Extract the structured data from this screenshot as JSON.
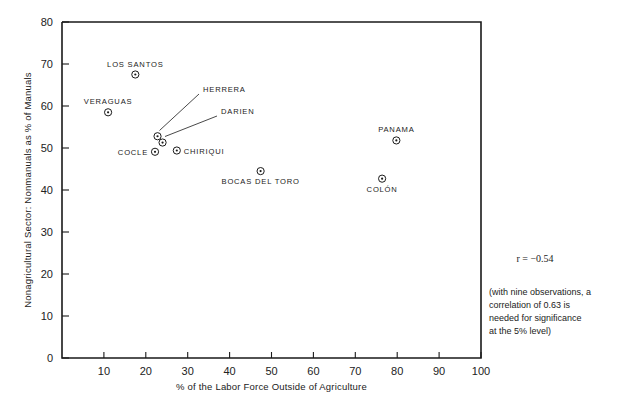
{
  "chart_data": {
    "type": "scatter",
    "title": "",
    "xlabel": "% of the Labor Force Outside of Agriculture",
    "ylabel": "Nonagricultural Sector: Nonmanuals as % of Manuals",
    "xlim": [
      0,
      100
    ],
    "ylim": [
      0,
      80
    ],
    "xticks": [
      10,
      20,
      30,
      40,
      50,
      60,
      70,
      80,
      90,
      100
    ],
    "yticks": [
      0,
      10,
      20,
      30,
      40,
      50,
      60,
      70,
      80
    ],
    "grid": false,
    "legend": "none",
    "points": [
      {
        "label": "LOS SANTOS",
        "x": 17.5,
        "y": 67.5,
        "label_pos": "above"
      },
      {
        "label": "VERAGUAS",
        "x": 11.0,
        "y": 58.5,
        "label_pos": "above"
      },
      {
        "label": "HERRERA",
        "x": 22.8,
        "y": 52.8,
        "label_pos": "leader"
      },
      {
        "label": "DARIEN",
        "x": 24.0,
        "y": 51.3,
        "label_pos": "leader"
      },
      {
        "label": "COCLE",
        "x": 22.2,
        "y": 49.1,
        "label_pos": "left"
      },
      {
        "label": "CHIRIQUI",
        "x": 27.4,
        "y": 49.4,
        "label_pos": "right"
      },
      {
        "label": "BOCAS DEL TORO",
        "x": 47.4,
        "y": 44.5,
        "label_pos": "below"
      },
      {
        "label": "PANAMA",
        "x": 79.8,
        "y": 51.8,
        "label_pos": "above"
      },
      {
        "label": "COLÓN",
        "x": 76.4,
        "y": 42.7,
        "label_pos": "below"
      }
    ],
    "annotations": {
      "correlation": "r = −0.54",
      "note_lines": [
        "(with nine observations, a",
        "correlation of 0.63 is",
        "needed for significance",
        "at the 5% level)"
      ]
    }
  },
  "figure": {
    "background_color": "#ffffff",
    "ink_color": "#1a1a1a"
  }
}
